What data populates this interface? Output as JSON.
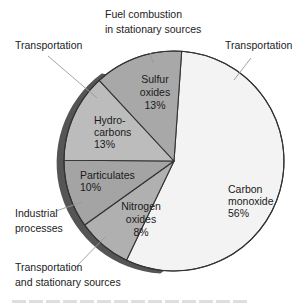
{
  "chart_data": {
    "type": "pie",
    "title": "",
    "start_direction": "slightly right of top, clockwise",
    "slices": [
      {
        "name": "Carbon monoxide",
        "label_lines": [
          "Carbon",
          "monoxide",
          "56%"
        ],
        "value": 56,
        "color": "#f3f3f3",
        "source": {
          "lines": [
            "Transportation"
          ]
        }
      },
      {
        "name": "Nitrogen oxides",
        "label_lines": [
          "Nitrogen",
          "oxides",
          "8%"
        ],
        "value": 8,
        "color": "#b0b0b0",
        "source": {
          "lines": [
            "Transportation",
            "and stationary sources"
          ]
        }
      },
      {
        "name": "Particulates",
        "label_lines": [
          "Particulates",
          "10%"
        ],
        "value": 10,
        "color": "#a4a4a4",
        "source": {
          "lines": [
            "Industrial",
            "processes"
          ]
        }
      },
      {
        "name": "Hydrocarbons",
        "label_lines": [
          "Hydro-",
          "carbons",
          "13%"
        ],
        "value": 13,
        "color": "#bcbcbc",
        "source": {
          "lines": [
            "Transportation"
          ]
        }
      },
      {
        "name": "Sulfur oxides",
        "label_lines": [
          "Sulfur",
          "oxides",
          "13%"
        ],
        "value": 13,
        "color": "#a8a8a8",
        "source": {
          "lines": [
            "Fuel combustion",
            "in stationary sources"
          ]
        }
      }
    ],
    "style": {
      "outline": "#333333",
      "rim_shadow": "#555555",
      "leader": "#999999"
    }
  }
}
